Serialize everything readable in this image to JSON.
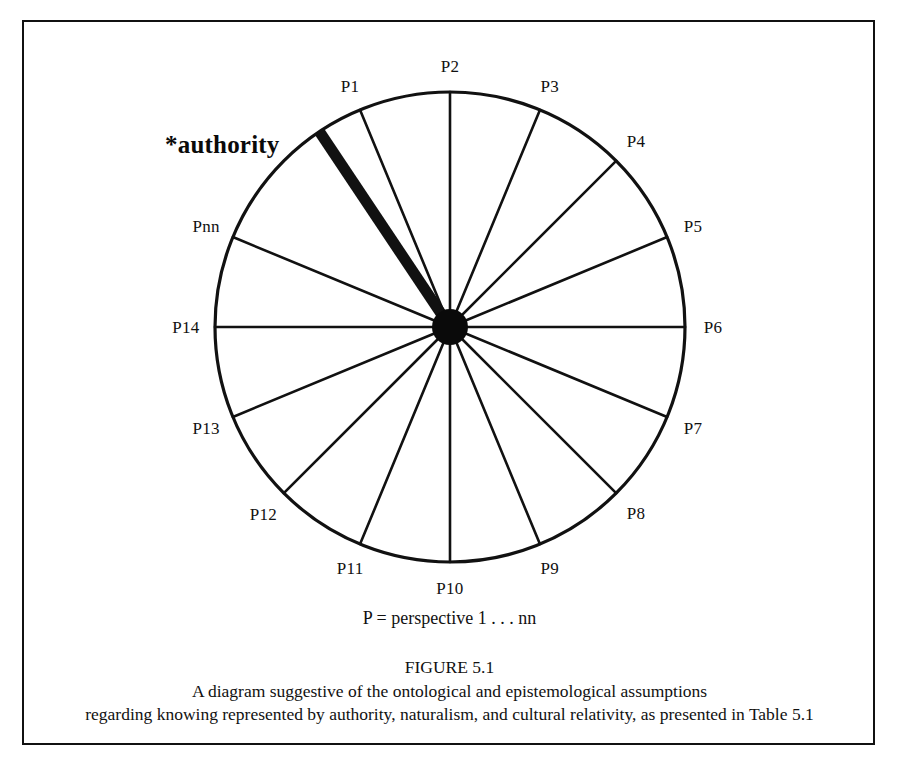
{
  "figure": {
    "legend": "P = perspective 1 . . . nn",
    "caption_title": "FIGURE 5.1",
    "caption_line_1": "A diagram suggestive of the ontological and epistemological assumptions",
    "caption_line_2": "regarding knowing represented by authority, naturalism, and cultural relativity, as presented in Table 5.1",
    "highlight_label": "*authority",
    "colors": {
      "ink": "#111111",
      "background": "#ffffff",
      "hub": "#0a0a0a"
    }
  },
  "chart_data": {
    "type": "pie",
    "title": "FIGURE 5.1",
    "subtitle": "A diagram suggestive of the ontological and epistemological assumptions regarding knowing represented by authority, naturalism, and cultural relativity, as presented in Table 5.1",
    "legend_note": "P = perspective 1 . . . nn",
    "center": [
      450,
      327
    ],
    "radius": 235,
    "hub_radius": 18,
    "slice_count": 16,
    "slice_angle_degrees": 22.5,
    "grid": false,
    "legend_position": "none",
    "annotations": [
      {
        "text": "*authority",
        "target_label": "authority-spoke",
        "angle_degrees": 123.75,
        "emphasis": "thick-spoke"
      }
    ],
    "categories": [
      "P1",
      "P2",
      "P3",
      "P4",
      "P5",
      "P6",
      "P7",
      "P8",
      "P9",
      "P10",
      "P11",
      "P12",
      "P13",
      "P14",
      "Pnn",
      "authority"
    ],
    "values": [
      1,
      1,
      1,
      1,
      1,
      1,
      1,
      1,
      1,
      1,
      1,
      1,
      1,
      1,
      1,
      1
    ],
    "spokes": [
      {
        "label": "P2",
        "angle_degrees": 90.0,
        "thick": false,
        "label_offset": 26
      },
      {
        "label": "P3",
        "angle_degrees": 67.5,
        "thick": false,
        "label_offset": 26
      },
      {
        "label": "P4",
        "angle_degrees": 45.0,
        "thick": false,
        "label_offset": 28
      },
      {
        "label": "P5",
        "angle_degrees": 22.5,
        "thick": false,
        "label_offset": 28
      },
      {
        "label": "P6",
        "angle_degrees": 0.0,
        "thick": false,
        "label_offset": 28
      },
      {
        "label": "P7",
        "angle_degrees": -22.5,
        "thick": false,
        "label_offset": 28
      },
      {
        "label": "P8",
        "angle_degrees": -45.0,
        "thick": false,
        "label_offset": 28
      },
      {
        "label": "P9",
        "angle_degrees": -67.5,
        "thick": false,
        "label_offset": 26
      },
      {
        "label": "P10",
        "angle_degrees": -90.0,
        "thick": false,
        "label_offset": 26
      },
      {
        "label": "P11",
        "angle_degrees": -112.5,
        "thick": false,
        "label_offset": 26
      },
      {
        "label": "P12",
        "angle_degrees": -135.0,
        "thick": false,
        "label_offset": 29
      },
      {
        "label": "P13",
        "angle_degrees": -157.5,
        "thick": false,
        "label_offset": 29
      },
      {
        "label": "P14",
        "angle_degrees": 180.0,
        "thick": false,
        "label_offset": 29
      },
      {
        "label": "Pnn",
        "angle_degrees": 157.5,
        "thick": false,
        "label_offset": 29
      },
      {
        "label": "authority",
        "angle_degrees": 123.75,
        "thick": true,
        "label_offset": 0
      },
      {
        "label": "P1",
        "angle_degrees": 112.5,
        "thick": false,
        "label_offset": 26
      }
    ]
  }
}
